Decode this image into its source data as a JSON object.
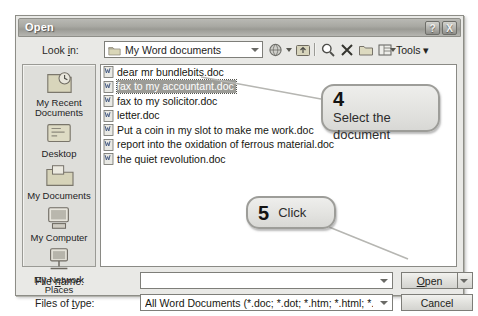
{
  "window": {
    "title": "Open",
    "help_button": "?",
    "close_button": "X"
  },
  "lookin": {
    "label": "Look in:",
    "value": "My Word documents",
    "folder_icon": "folder-icon",
    "dropdown_icon": "chevron-down-icon"
  },
  "toolbar": {
    "items": [
      {
        "name": "back-icon",
        "label": ""
      },
      {
        "name": "up-one-level-icon",
        "label": ""
      },
      {
        "name": "search-web-icon",
        "label": ""
      },
      {
        "name": "delete-icon",
        "label": ""
      },
      {
        "name": "new-folder-icon",
        "label": ""
      },
      {
        "name": "views-icon",
        "label": ""
      }
    ],
    "tools_label": "Tools"
  },
  "places": {
    "items": [
      {
        "label": "My Recent Documents",
        "icon": "recent-documents-icon"
      },
      {
        "label": "Desktop",
        "icon": "desktop-icon"
      },
      {
        "label": "My Documents",
        "icon": "my-documents-icon"
      },
      {
        "label": "My Computer",
        "icon": "my-computer-icon"
      },
      {
        "label": "My Network Places",
        "icon": "network-places-icon"
      }
    ]
  },
  "filelist": {
    "icon": "word-document-icon",
    "files": [
      {
        "name": "dear mr bundlebits.doc",
        "selected": false
      },
      {
        "name": "fax to my accountant.doc",
        "selected": true
      },
      {
        "name": "fax to my solicitor.doc",
        "selected": false
      },
      {
        "name": "letter.doc",
        "selected": false
      },
      {
        "name": "Put a coin in my slot to make me work.doc",
        "selected": false
      },
      {
        "name": "report into the oxidation of ferrous material.doc",
        "selected": false
      },
      {
        "name": "the quiet revolution.doc",
        "selected": false
      }
    ]
  },
  "filename": {
    "label_pre": "File ",
    "label_underlined": "n",
    "label_post": "ame:",
    "value": "",
    "placeholder": ""
  },
  "filetype": {
    "label_pre": "Files of ",
    "label_underlined": "t",
    "label_post": "ype:",
    "value": "All Word Documents (*.doc; *.dot; *.htm; *.html; *.url; *"
  },
  "buttons": {
    "open_pre": "",
    "open_underlined": "O",
    "open_post": "pen",
    "open_label": "Open",
    "cancel_label": "Cancel",
    "open_dropdown_icon": "chevron-down-icon"
  },
  "callouts": [
    {
      "number": "4",
      "text": "Select the document"
    },
    {
      "number": "5",
      "text": "Click"
    }
  ],
  "colors": {
    "page_background": "#ffffff",
    "dialog_face": "#e9e9e6",
    "titlebar": "#a9a9a3",
    "selection": "#9c9c97",
    "callout_fill": "#e3e3e0",
    "callout_border": "#9d9d99",
    "leader_line": "#b0b0ac"
  }
}
